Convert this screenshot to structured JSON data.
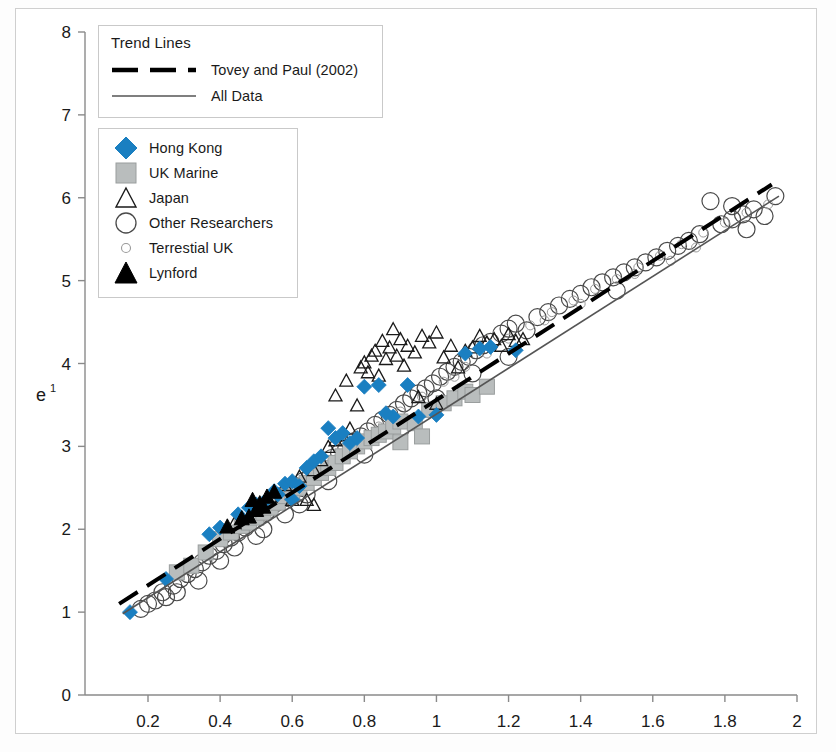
{
  "figure": {
    "background": "#ffffff",
    "frame_color": "#cfcfcf"
  },
  "legend_trend": {
    "title": "Trend Lines",
    "items": [
      {
        "label": "Tovey and Paul (2002)",
        "style": "dashed",
        "color": "#000000",
        "icon": "dashed-line-icon"
      },
      {
        "label": "All Data",
        "style": "solid",
        "color": "#555555",
        "icon": "solid-line-icon"
      }
    ]
  },
  "legend_series": {
    "items": [
      {
        "label": "Hong Kong",
        "marker": "diamond",
        "fill": "#1a7fc1",
        "stroke": "#1a7fc1",
        "icon": "blue-diamond-icon"
      },
      {
        "label": "UK Marine",
        "marker": "square",
        "fill": "#b9bdbd",
        "stroke": "#9a9e9e",
        "icon": "gray-square-icon"
      },
      {
        "label": "Japan",
        "marker": "triangle-open",
        "fill": "none",
        "stroke": "#1a1a1a",
        "icon": "open-triangle-icon"
      },
      {
        "label": "Other Researchers",
        "marker": "circle-open",
        "fill": "none",
        "stroke": "#4a4a4a",
        "icon": "open-circle-icon"
      },
      {
        "label": "Terrestial UK",
        "marker": "circle-open-small",
        "fill": "none",
        "stroke": "#9a9a9a",
        "icon": "small-open-circle-icon"
      },
      {
        "label": "Lynford",
        "marker": "triangle-filled",
        "fill": "#000000",
        "stroke": "#000000",
        "icon": "black-triangle-icon"
      }
    ]
  },
  "chart_data": {
    "type": "scatter",
    "title": "",
    "xlabel": "",
    "ylabel": "e",
    "ylabel_sup": "1",
    "xlim": [
      0.08,
      2.0
    ],
    "ylim": [
      0,
      8
    ],
    "xticks": [
      0.2,
      0.4,
      0.6,
      0.8,
      1,
      1.2,
      1.4,
      1.6,
      1.8,
      2
    ],
    "xticklabels": [
      "0.2",
      "0.4",
      "0.6",
      "0.8",
      "1",
      "1.2",
      "1.4",
      "1.6",
      "1.8",
      "2"
    ],
    "yticks": [
      0,
      1,
      2,
      3,
      4,
      5,
      6,
      7,
      8
    ],
    "yticklabels": [
      "0",
      "1",
      "2",
      "3",
      "4",
      "5",
      "6",
      "7",
      "8"
    ],
    "grid": false,
    "legend_position": "upper-left",
    "series": [
      {
        "name": "Hong Kong",
        "marker": "diamond",
        "fill": "#1a7fc1",
        "size": 15,
        "points": [
          [
            0.15,
            1.0
          ],
          [
            0.25,
            1.4
          ],
          [
            0.37,
            1.94
          ],
          [
            0.4,
            2.02
          ],
          [
            0.45,
            2.18
          ],
          [
            0.48,
            2.26
          ],
          [
            0.5,
            2.3
          ],
          [
            0.52,
            2.32
          ],
          [
            0.55,
            2.46
          ],
          [
            0.58,
            2.55
          ],
          [
            0.6,
            2.58
          ],
          [
            0.62,
            2.52
          ],
          [
            0.64,
            2.74
          ],
          [
            0.66,
            2.82
          ],
          [
            0.68,
            2.88
          ],
          [
            0.7,
            3.22
          ],
          [
            0.72,
            3.1
          ],
          [
            0.74,
            3.16
          ],
          [
            0.76,
            3.04
          ],
          [
            0.78,
            3.1
          ],
          [
            0.8,
            3.72
          ],
          [
            0.84,
            3.74
          ],
          [
            0.88,
            3.36
          ],
          [
            0.92,
            3.74
          ],
          [
            0.95,
            3.36
          ],
          [
            1.0,
            3.38
          ],
          [
            1.08,
            4.12
          ],
          [
            1.12,
            4.18
          ],
          [
            1.15,
            4.2
          ],
          [
            1.22,
            4.16
          ],
          [
            0.56,
            2.42
          ],
          [
            0.6,
            2.36
          ],
          [
            0.86,
            3.4
          ]
        ]
      },
      {
        "name": "UK Marine",
        "marker": "square",
        "fill": "#b9bdbd",
        "size": 15,
        "points": [
          [
            0.28,
            1.48
          ],
          [
            0.32,
            1.56
          ],
          [
            0.36,
            1.72
          ],
          [
            0.4,
            1.88
          ],
          [
            0.43,
            1.96
          ],
          [
            0.46,
            2.04
          ],
          [
            0.48,
            2.08
          ],
          [
            0.5,
            2.14
          ],
          [
            0.52,
            2.2
          ],
          [
            0.54,
            2.26
          ],
          [
            0.56,
            2.32
          ],
          [
            0.58,
            2.4
          ],
          [
            0.6,
            2.44
          ],
          [
            0.62,
            2.5
          ],
          [
            0.64,
            2.56
          ],
          [
            0.66,
            2.62
          ],
          [
            0.68,
            2.68
          ],
          [
            0.7,
            2.74
          ],
          [
            0.72,
            2.8
          ],
          [
            0.74,
            2.88
          ],
          [
            0.76,
            2.94
          ],
          [
            0.78,
            3.0
          ],
          [
            0.8,
            3.06
          ],
          [
            0.82,
            3.1
          ],
          [
            0.84,
            3.14
          ],
          [
            0.86,
            3.18
          ],
          [
            0.88,
            3.24
          ],
          [
            0.9,
            3.3
          ],
          [
            0.94,
            3.28
          ],
          [
            0.98,
            3.44
          ],
          [
            1.02,
            3.52
          ],
          [
            1.05,
            3.58
          ],
          [
            1.08,
            3.66
          ],
          [
            1.1,
            3.62
          ],
          [
            1.14,
            3.72
          ],
          [
            0.9,
            3.05
          ],
          [
            0.96,
            3.12
          ]
        ]
      },
      {
        "name": "Japan",
        "marker": "triangle-open",
        "stroke": "#1a1a1a",
        "size": 13,
        "points": [
          [
            0.44,
            2.08
          ],
          [
            0.5,
            2.26
          ],
          [
            0.54,
            2.4
          ],
          [
            0.58,
            2.54
          ],
          [
            0.6,
            2.36
          ],
          [
            0.62,
            2.64
          ],
          [
            0.64,
            2.36
          ],
          [
            0.66,
            2.72
          ],
          [
            0.68,
            2.84
          ],
          [
            0.7,
            3.0
          ],
          [
            0.72,
            3.08
          ],
          [
            0.74,
            3.14
          ],
          [
            0.75,
            3.8
          ],
          [
            0.76,
            3.22
          ],
          [
            0.78,
            3.5
          ],
          [
            0.79,
            3.96
          ],
          [
            0.8,
            4.02
          ],
          [
            0.81,
            3.9
          ],
          [
            0.82,
            4.1
          ],
          [
            0.83,
            4.16
          ],
          [
            0.84,
            3.86
          ],
          [
            0.85,
            4.28
          ],
          [
            0.86,
            4.06
          ],
          [
            0.87,
            4.2
          ],
          [
            0.88,
            4.42
          ],
          [
            0.89,
            4.1
          ],
          [
            0.9,
            4.3
          ],
          [
            0.91,
            3.98
          ],
          [
            0.92,
            4.22
          ],
          [
            0.94,
            4.14
          ],
          [
            0.96,
            4.34
          ],
          [
            0.98,
            4.26
          ],
          [
            1.0,
            4.38
          ],
          [
            1.02,
            4.08
          ],
          [
            1.04,
            4.22
          ],
          [
            1.06,
            3.96
          ],
          [
            1.08,
            4.16
          ],
          [
            1.1,
            4.2
          ],
          [
            1.12,
            4.34
          ],
          [
            1.14,
            4.26
          ],
          [
            1.16,
            4.3
          ],
          [
            1.18,
            4.22
          ],
          [
            1.2,
            4.36
          ],
          [
            1.22,
            4.28
          ],
          [
            1.24,
            4.3
          ],
          [
            0.72,
            3.62
          ],
          [
            0.95,
            3.6
          ],
          [
            1.0,
            3.52
          ],
          [
            0.66,
            2.3
          ]
        ]
      },
      {
        "name": "Other Researchers",
        "marker": "circle-open",
        "stroke": "#4a4a4a",
        "size": 17,
        "points": [
          [
            0.18,
            1.04
          ],
          [
            0.2,
            1.1
          ],
          [
            0.22,
            1.14
          ],
          [
            0.24,
            1.24
          ],
          [
            0.25,
            1.18
          ],
          [
            0.27,
            1.32
          ],
          [
            0.29,
            1.4
          ],
          [
            0.31,
            1.46
          ],
          [
            0.33,
            1.52
          ],
          [
            0.35,
            1.6
          ],
          [
            0.37,
            1.68
          ],
          [
            0.39,
            1.74
          ],
          [
            0.41,
            1.82
          ],
          [
            0.43,
            1.9
          ],
          [
            0.45,
            1.96
          ],
          [
            0.47,
            2.02
          ],
          [
            0.49,
            2.1
          ],
          [
            0.51,
            2.16
          ],
          [
            0.53,
            2.22
          ],
          [
            0.55,
            2.3
          ],
          [
            0.57,
            2.36
          ],
          [
            0.59,
            2.44
          ],
          [
            0.61,
            2.52
          ],
          [
            0.63,
            2.58
          ],
          [
            0.65,
            2.64
          ],
          [
            0.67,
            2.72
          ],
          [
            0.69,
            2.78
          ],
          [
            0.71,
            2.86
          ],
          [
            0.73,
            2.92
          ],
          [
            0.75,
            2.98
          ],
          [
            0.77,
            3.06
          ],
          [
            0.79,
            3.12
          ],
          [
            0.81,
            3.18
          ],
          [
            0.83,
            3.26
          ],
          [
            0.85,
            3.32
          ],
          [
            0.87,
            3.38
          ],
          [
            0.89,
            3.44
          ],
          [
            0.91,
            3.52
          ],
          [
            0.93,
            3.58
          ],
          [
            0.95,
            3.64
          ],
          [
            0.97,
            3.7
          ],
          [
            0.99,
            3.76
          ],
          [
            1.01,
            3.84
          ],
          [
            1.03,
            3.9
          ],
          [
            1.05,
            3.96
          ],
          [
            1.07,
            4.02
          ],
          [
            1.09,
            4.08
          ],
          [
            1.11,
            4.16
          ],
          [
            1.13,
            4.22
          ],
          [
            1.15,
            4.26
          ],
          [
            1.18,
            4.36
          ],
          [
            1.2,
            4.42
          ],
          [
            1.22,
            4.48
          ],
          [
            1.25,
            4.4
          ],
          [
            1.28,
            4.56
          ],
          [
            1.31,
            4.62
          ],
          [
            1.34,
            4.7
          ],
          [
            1.37,
            4.78
          ],
          [
            1.4,
            4.84
          ],
          [
            1.43,
            4.92
          ],
          [
            1.46,
            4.98
          ],
          [
            1.49,
            5.04
          ],
          [
            1.52,
            5.1
          ],
          [
            1.55,
            5.16
          ],
          [
            1.58,
            5.22
          ],
          [
            1.61,
            5.28
          ],
          [
            1.64,
            5.36
          ],
          [
            1.67,
            5.42
          ],
          [
            1.7,
            5.48
          ],
          [
            1.73,
            5.56
          ],
          [
            1.76,
            5.96
          ],
          [
            1.79,
            5.68
          ],
          [
            1.82,
            5.74
          ],
          [
            1.85,
            5.8
          ],
          [
            1.88,
            5.86
          ],
          [
            1.91,
            5.78
          ],
          [
            1.94,
            6.02
          ],
          [
            1.82,
            5.9
          ],
          [
            1.86,
            5.62
          ],
          [
            1.5,
            4.88
          ],
          [
            0.44,
            1.78
          ],
          [
            0.5,
            1.92
          ],
          [
            0.58,
            2.18
          ],
          [
            0.64,
            2.42
          ],
          [
            0.7,
            2.58
          ],
          [
            0.8,
            2.9
          ],
          [
            0.9,
            3.2
          ],
          [
            1.0,
            3.58
          ],
          [
            1.1,
            3.88
          ],
          [
            1.2,
            4.08
          ],
          [
            0.28,
            1.24
          ],
          [
            0.34,
            1.38
          ],
          [
            0.4,
            1.62
          ],
          [
            0.52,
            2.0
          ],
          [
            0.62,
            2.3
          ]
        ]
      },
      {
        "name": "Terrestial UK",
        "marker": "circle-open-small",
        "stroke": "#9a9a9a",
        "size": 9,
        "points": [
          [
            0.6,
            2.48
          ],
          [
            0.66,
            2.66
          ],
          [
            0.72,
            2.84
          ],
          [
            0.78,
            3.02
          ],
          [
            0.84,
            3.24
          ],
          [
            0.9,
            3.42
          ],
          [
            0.96,
            3.6
          ],
          [
            1.02,
            3.78
          ],
          [
            1.08,
            3.96
          ],
          [
            1.14,
            4.12
          ],
          [
            1.2,
            4.3
          ],
          [
            1.26,
            4.46
          ],
          [
            1.32,
            4.62
          ],
          [
            1.38,
            4.76
          ],
          [
            1.44,
            4.9
          ],
          [
            1.5,
            5.02
          ],
          [
            1.56,
            5.16
          ],
          [
            1.62,
            5.3
          ],
          [
            1.68,
            5.44
          ],
          [
            1.74,
            5.58
          ],
          [
            1.8,
            5.7
          ],
          [
            1.86,
            5.82
          ],
          [
            1.92,
            5.92
          ],
          [
            1.3,
            4.52
          ],
          [
            1.4,
            4.72
          ],
          [
            1.55,
            5.08
          ],
          [
            1.65,
            5.24
          ],
          [
            1.72,
            5.4
          ],
          [
            0.88,
            3.34
          ],
          [
            1.05,
            3.84
          ]
        ]
      },
      {
        "name": "Lynford",
        "marker": "triangle-filled",
        "fill": "#000000",
        "size": 15,
        "points": [
          [
            0.42,
            2.04
          ],
          [
            0.46,
            2.14
          ],
          [
            0.48,
            2.16
          ],
          [
            0.5,
            2.24
          ],
          [
            0.51,
            2.32
          ],
          [
            0.53,
            2.4
          ],
          [
            0.55,
            2.46
          ],
          [
            0.49,
            2.36
          ],
          [
            0.52,
            2.28
          ]
        ]
      }
    ],
    "trend_lines": [
      {
        "name": "Tovey and Paul (2002)",
        "style": "dashed",
        "color": "#000000",
        "width": 4,
        "x0": 0.12,
        "y0": 1.1,
        "x1": 1.93,
        "y1": 6.16
      },
      {
        "name": "All Data",
        "style": "solid",
        "color": "#555555",
        "width": 1.6,
        "x0": 0.13,
        "y0": 0.98,
        "x1": 1.95,
        "y1": 6.02
      }
    ]
  }
}
